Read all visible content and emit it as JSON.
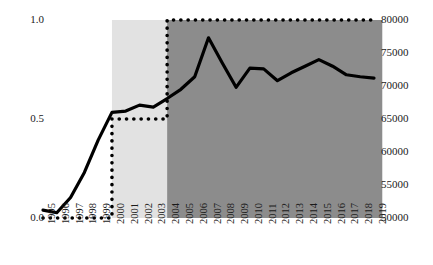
{
  "chart_data": {
    "type": "line",
    "title": "",
    "subtitle": "",
    "xlabel": "",
    "ylabel": "",
    "grid": false,
    "legend_position": "none",
    "x": [
      1995,
      1996,
      1997,
      1998,
      1999,
      2000,
      2001,
      2002,
      2003,
      2004,
      2005,
      2006,
      2007,
      2008,
      2009,
      2010,
      2011,
      2012,
      2013,
      2014,
      2015,
      2016,
      2017,
      2018,
      2019
    ],
    "xticklabels": [
      "1995",
      "1996",
      "1997",
      "1998",
      "1999",
      "2000",
      "2001",
      "2002",
      "2003",
      "2004",
      "2005",
      "2006",
      "2007",
      "2008",
      "2009",
      "2010",
      "2011",
      "2012",
      "2013",
      "2014",
      "2015",
      "2016",
      "2017",
      "2018",
      "2019"
    ],
    "xlim": [
      1995,
      2019
    ],
    "axes": [
      {
        "id": "left",
        "side": "left",
        "ylim": [
          0.0,
          1.0
        ],
        "ticks": [
          0.0,
          0.5,
          1.0
        ],
        "ticklabels": [
          "0.0",
          "0.5",
          "1.0"
        ]
      },
      {
        "id": "right",
        "side": "right",
        "ylim": [
          50000,
          80000
        ],
        "ticks": [
          50000,
          55000,
          60000,
          65000,
          70000,
          75000,
          80000
        ],
        "ticklabels": [
          "50000",
          "55000",
          "60000",
          "65000",
          "70000",
          "75000",
          "80000"
        ]
      }
    ],
    "series": [
      {
        "name": "solid-line-series",
        "style": "solid",
        "axis": "right",
        "color": "#000000",
        "linewidth": 3.2,
        "values": [
          51200,
          50800,
          53100,
          56900,
          61800,
          66000,
          66200,
          67100,
          66800,
          68100,
          69500,
          71400,
          77300,
          73500,
          69800,
          72700,
          72600,
          70800,
          72000,
          73000,
          74000,
          73000,
          71700,
          71400,
          71200
        ]
      },
      {
        "name": "dotted-step-series",
        "style": "dotted",
        "axis": "left",
        "color": "#000000",
        "linewidth": 3.6,
        "values": [
          0.0,
          0.0,
          0.0,
          0.0,
          0.0,
          0.5,
          0.5,
          0.5,
          0.5,
          1.0,
          1.0,
          1.0,
          1.0,
          1.0,
          1.0,
          1.0,
          1.0,
          1.0,
          1.0,
          1.0,
          1.0,
          1.0,
          1.0,
          1.0,
          1.0
        ]
      }
    ],
    "shaded_bands": [
      {
        "name": "light-band",
        "from": 2000,
        "to": 2004,
        "color": "#e2e2e2"
      },
      {
        "name": "dark-band",
        "from": 2004,
        "to": 2019.6,
        "color": "#8c8c8c"
      }
    ]
  }
}
